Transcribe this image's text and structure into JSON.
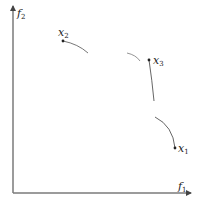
{
  "diagram": {
    "type": "pareto-objective-space",
    "axes": {
      "x": {
        "label": "f",
        "subscript": "1"
      },
      "y": {
        "label": "f",
        "subscript": "2"
      }
    },
    "points": [
      {
        "id": "x1",
        "label": "x",
        "subscript": "1",
        "pos": [
          175,
          148
        ]
      },
      {
        "id": "x2",
        "label": "x",
        "subscript": "2",
        "pos": [
          63,
          41
        ]
      },
      {
        "id": "x3",
        "label": "x",
        "subscript": "3",
        "pos": [
          149,
          60
        ]
      }
    ],
    "colors": {
      "axis": "#7a7a7a",
      "curve": "#555555",
      "point": "#222222",
      "background": "#ffffff"
    }
  }
}
